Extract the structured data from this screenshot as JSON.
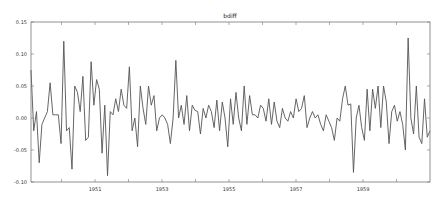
{
  "chart_data": {
    "type": "line",
    "title": "bdiff",
    "xlabel": "",
    "ylabel": "",
    "ylim": [
      -0.1,
      0.15
    ],
    "yticks": [
      "0.15",
      "0.10",
      "0.05",
      "0.00",
      "-0.05",
      "-0.10"
    ],
    "xticks": [
      "1951",
      "1953",
      "1955",
      "1957",
      "1959"
    ],
    "xrange": [
      "1949-02",
      "1960-12"
    ],
    "grid": false,
    "legend": null,
    "line_color": "#555555",
    "series": [
      {
        "name": "bdiff",
        "values": [
          0.075,
          -0.02,
          0.01,
          -0.07,
          -0.01,
          0.0,
          0.01,
          0.055,
          0.005,
          0.005,
          0.005,
          -0.04,
          0.12,
          -0.02,
          -0.015,
          -0.08,
          0.05,
          0.04,
          0.01,
          0.065,
          -0.035,
          -0.03,
          0.088,
          0.02,
          0.06,
          0.045,
          -0.055,
          0.02,
          -0.09,
          0.01,
          0.005,
          0.03,
          0.01,
          0.045,
          0.02,
          0.015,
          0.08,
          -0.02,
          0.0,
          -0.045,
          0.05,
          0.015,
          -0.01,
          0.05,
          0.02,
          0.035,
          -0.02,
          0.0,
          0.005,
          0.0,
          -0.01,
          -0.04,
          0.0,
          0.09,
          0.0,
          0.02,
          -0.01,
          0.035,
          -0.02,
          0.02,
          0.012,
          0.01,
          -0.025,
          0.015,
          0.0,
          0.02,
          0.01,
          -0.015,
          0.028,
          -0.02,
          0.025,
          0.0,
          -0.045,
          0.03,
          -0.01,
          0.04,
          0.0,
          -0.02,
          0.05,
          -0.01,
          0.035,
          0.005,
          0.005,
          0.0,
          0.02,
          0.015,
          -0.005,
          0.03,
          -0.01,
          0.025,
          -0.005,
          -0.015,
          0.015,
          0.0,
          -0.005,
          0.01,
          0.0,
          0.03,
          0.01,
          0.015,
          0.035,
          -0.015,
          0.0,
          0.01,
          0.0,
          0.005,
          -0.01,
          -0.02,
          0.005,
          -0.005,
          -0.015,
          -0.035,
          0.0,
          -0.005,
          0.03,
          0.05,
          0.02,
          0.022,
          -0.085,
          0.0,
          0.02,
          -0.015,
          -0.035,
          0.045,
          -0.02,
          0.045,
          0.015,
          0.05,
          -0.015,
          0.05,
          0.025,
          -0.04,
          0.01,
          0.02,
          -0.005,
          0.01,
          -0.01,
          -0.05,
          0.125,
          0.0,
          -0.025,
          0.05,
          -0.03,
          -0.04,
          0.03,
          -0.03,
          -0.02
        ]
      }
    ]
  }
}
